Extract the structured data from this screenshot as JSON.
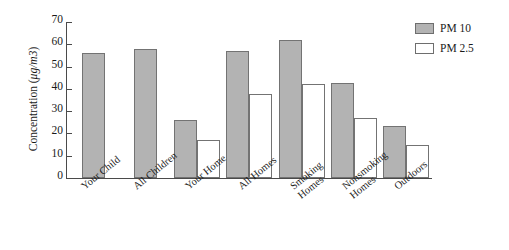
{
  "chart_data": {
    "type": "bar",
    "title": "",
    "xlabel": "",
    "ylabel": "Concentration (μg/m3)",
    "ylabel_prefix": "Concentration (",
    "ylabel_unit": "μg/m3",
    "ylabel_suffix": ")",
    "ylim": [
      0,
      70
    ],
    "ytick_values": [
      70,
      60,
      50,
      40,
      30,
      20,
      10,
      0
    ],
    "ytick_labels": [
      "70",
      "60",
      "50",
      "40",
      "30",
      "20",
      "10",
      "0"
    ],
    "grid": false,
    "legend_position": "upper right",
    "categories": [
      "Your Child",
      "All Children",
      "Your Home",
      "All Homes",
      "Smoking Homes",
      "Nonsmoking Homes",
      "Outdoors"
    ],
    "category_lines": [
      [
        "Your Child"
      ],
      [
        "All Children"
      ],
      [
        "Your Home"
      ],
      [
        "All Homes"
      ],
      [
        "Smoking",
        "Homes"
      ],
      [
        "Nonsmoking",
        "Homes"
      ],
      [
        "Outdoors"
      ]
    ],
    "series": [
      {
        "name": "PM 10",
        "color": "#b3b3b3",
        "values": [
          56,
          58,
          26,
          57,
          62,
          42.5,
          23.5
        ]
      },
      {
        "name": "PM 2.5",
        "color": "#ffffff",
        "values": [
          null,
          null,
          17,
          37.5,
          42,
          27,
          15
        ]
      }
    ]
  },
  "legend": {
    "items": [
      {
        "label": "PM 10",
        "swatch": "pm10"
      },
      {
        "label": "PM 2.5",
        "swatch": "pm25"
      }
    ]
  },
  "colors": {
    "pm10_fill": "#b3b3b3",
    "pm25_fill": "#ffffff",
    "bar_edge": "#737373",
    "axis": "#4a4a4a",
    "text": "#1a1a1a",
    "background": "#ffffff"
  }
}
